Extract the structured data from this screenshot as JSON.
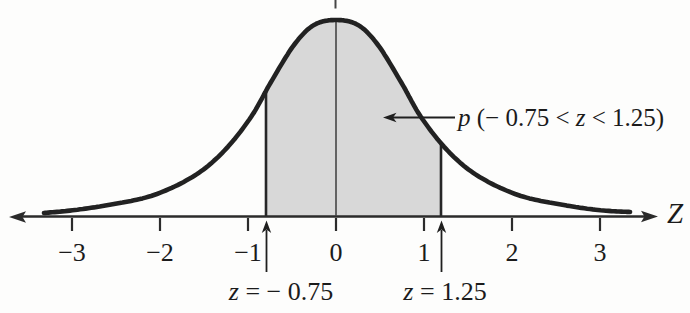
{
  "figure": {
    "background": "#fdfdfc",
    "curve_color": "#222222",
    "shade_color": "#d8d8d8",
    "axis_color": "#2b2b2b",
    "text_color": "#1b1b1b",
    "origin_x": 336,
    "px_per_unit": 88,
    "baseline_y": 216.5
  },
  "chart_data": {
    "type": "area",
    "title": "",
    "xlabel": "Z",
    "ylabel": "",
    "curve": "standard normal (z) density, unlabeled y-axis",
    "x_ticks": [
      -3,
      -2,
      -1,
      0,
      1,
      2,
      3
    ],
    "x_tick_labels": [
      "−3",
      "−2",
      "−1",
      "0",
      "1",
      "2",
      "3"
    ],
    "x_range_drawn": [
      -3.35,
      3.35
    ],
    "shaded_interval": [
      -0.75,
      1.25
    ],
    "shaded_region_label": "p (− 0.75 < z < 1.25)",
    "boundary_annotations": [
      {
        "z": -0.75,
        "label": "z = − 0.75"
      },
      {
        "z": 1.25,
        "label": "z = 1.25"
      }
    ],
    "grid": false,
    "legend": "none"
  },
  "curve": {
    "points": [
      [
        44,
        213
      ],
      [
        75,
        210
      ],
      [
        114,
        204
      ],
      [
        154,
        195
      ],
      [
        194,
        176
      ],
      [
        224,
        151
      ],
      [
        251,
        117
      ],
      [
        271,
        82
      ],
      [
        294,
        45
      ],
      [
        314,
        25
      ],
      [
        336,
        20
      ],
      [
        358,
        25
      ],
      [
        378,
        45
      ],
      [
        401,
        82
      ],
      [
        421,
        117
      ],
      [
        448,
        151
      ],
      [
        478,
        176
      ],
      [
        518,
        195
      ],
      [
        558,
        204
      ],
      [
        598,
        210
      ],
      [
        630,
        212
      ]
    ]
  },
  "region": {
    "x_left_px": 266,
    "x_right_px": 441
  },
  "axis": {
    "label": "Z",
    "ticks": [
      {
        "z": -3,
        "label": "−3"
      },
      {
        "z": -2,
        "label": "−2"
      },
      {
        "z": -1,
        "label": "−1"
      },
      {
        "z": 0,
        "label": "0"
      },
      {
        "z": 1,
        "label": "1"
      },
      {
        "z": 2,
        "label": "2"
      },
      {
        "z": 3,
        "label": "3"
      }
    ]
  },
  "annotations": {
    "region_label": {
      "var1": "p",
      "mid": " (− 0.75 < ",
      "var2": "z",
      "post": " < 1.25)"
    },
    "left_bound": {
      "var": "z",
      "rest": " = − 0.75"
    },
    "right_bound": {
      "var": "z",
      "rest": " = 1.25"
    }
  }
}
